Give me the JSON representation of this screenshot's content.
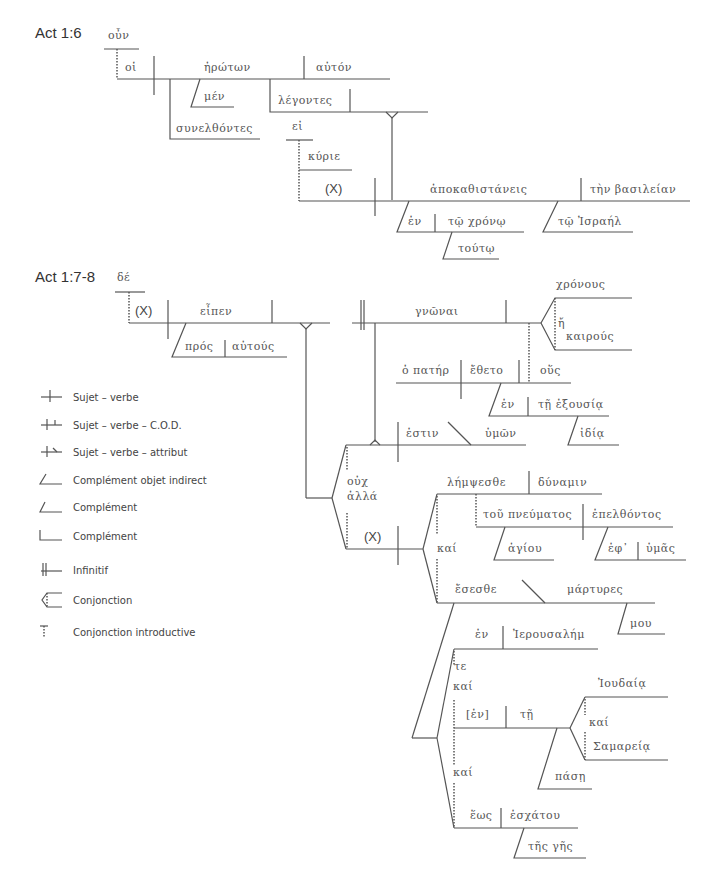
{
  "diagram": {
    "sections": [
      {
        "label": "Act 1:6",
        "words": {
          "oun": "οὖν",
          "hoi": "οἱ",
          "erotwn": "ἠρώτων",
          "auton": "αὐτόν",
          "men": "μέν",
          "legontes": "λέγοντες",
          "synelthontes": "συνελθόντες",
          "ei": "εἰ",
          "kyrie": "κύριε",
          "x": "(X)",
          "apokathistaneis": "ἀποκαθιστάνεις",
          "ten_basileian": "τὴν βασιλείαν",
          "en": "ἐν",
          "to_chrono": "τῷ χρόνῳ",
          "toutw": "τούτῳ",
          "to_israel": "τῷ Ἰσραήλ"
        }
      },
      {
        "label": "Act 1:7-8",
        "words": {
          "de": "δέ",
          "x1": "(X)",
          "eipen": "εἶπεν",
          "pros": "πρός",
          "autous": "αὐτούς",
          "gnwnai": "γνῶναι",
          "chronous": "χρόνους",
          "e": "ἤ",
          "kairous": "καιρούς",
          "ho_pater": "ὁ πατήρ",
          "etheto": "ἔθετο",
          "hous": "οὕς",
          "en1": "ἐν",
          "te_exousia": "τῇ ἐξουσίᾳ",
          "idia": "ἰδίᾳ",
          "estin": "ἐστιν",
          "hymwn": "ὑμῶν",
          "ouch": "οὐχ",
          "alla": "ἀλλά",
          "x2": "(X)",
          "lempsesthe": "λήμψεσθε",
          "dynamin": "δύναμιν",
          "tou_pneumatos": "τοῦ πνεύματος",
          "epelthontos": "ἐπελθόντος",
          "hagiou": "ἁγίου",
          "eph": "ἐφ᾽",
          "hymas": "ὑμᾶς",
          "kai1": "καί",
          "esesthe": "ἔσεσθε",
          "martyres": "μάρτυρες",
          "mou": "μου",
          "en2": "ἐν",
          "ierousalem": "Ἰερουσαλήμ",
          "te": "τε",
          "kai2": "καί",
          "en3": "[ἐν]",
          "te2": "τῇ",
          "ioudaia": "Ἰουδαίᾳ",
          "kai3": "καί",
          "samareia": "Σαμαρείᾳ",
          "pase": "πάσῃ",
          "kai4": "καί",
          "hews": "ἕως",
          "eschatou": "ἐσχάτου",
          "tes_ges": "τῆς γῆς"
        }
      }
    ],
    "legend": [
      {
        "symbol": "subject-verb",
        "label": "Sujet – verbe"
      },
      {
        "symbol": "subject-verb-object",
        "label": "Sujet – verbe – C.O.D."
      },
      {
        "symbol": "subject-verb-attribute",
        "label": "Sujet – verbe – attribut"
      },
      {
        "symbol": "indirect-object",
        "label": "Complément objet indirect"
      },
      {
        "symbol": "complement-slant",
        "label": "Complément"
      },
      {
        "symbol": "complement-step",
        "label": "Complément"
      },
      {
        "symbol": "infinitive",
        "label": "Infinitif"
      },
      {
        "symbol": "conjunction",
        "label": "Conjonction"
      },
      {
        "symbol": "introductory-conjunction",
        "label": "Conjonction introductive"
      }
    ]
  }
}
